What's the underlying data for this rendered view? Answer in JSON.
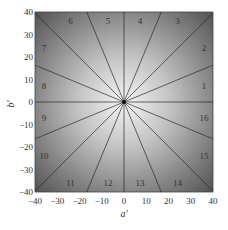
{
  "chart_data": {
    "type": "diagram-sectors",
    "title": "",
    "xlabel": "a′",
    "ylabel": "b′",
    "xlim": [
      -40,
      40
    ],
    "ylim": [
      -40,
      40
    ],
    "xticks": [
      -40,
      -30,
      -20,
      -10,
      0,
      10,
      20,
      30,
      40
    ],
    "yticks": [
      -40,
      -30,
      -20,
      -10,
      0,
      10,
      20,
      30,
      40
    ],
    "grid": false,
    "sector_count": 16,
    "sector_angle_deg": 22.5,
    "boundary_angles_deg": [
      0,
      22.5,
      45,
      67.5,
      90,
      112.5,
      135,
      157.5,
      180,
      202.5,
      225,
      247.5,
      270,
      292.5,
      315,
      337.5
    ],
    "sectors": [
      {
        "label": "1",
        "center_angle_deg": 11.25
      },
      {
        "label": "2",
        "center_angle_deg": 33.75
      },
      {
        "label": "3",
        "center_angle_deg": 56.25
      },
      {
        "label": "4",
        "center_angle_deg": 78.75
      },
      {
        "label": "5",
        "center_angle_deg": 101.25
      },
      {
        "label": "6",
        "center_angle_deg": 123.75
      },
      {
        "label": "7",
        "center_angle_deg": 146.25
      },
      {
        "label": "8",
        "center_angle_deg": 168.75
      },
      {
        "label": "9",
        "center_angle_deg": 191.25
      },
      {
        "label": "10",
        "center_angle_deg": 213.75
      },
      {
        "label": "11",
        "center_angle_deg": 236.25
      },
      {
        "label": "12",
        "center_angle_deg": 258.75
      },
      {
        "label": "13",
        "center_angle_deg": 281.25
      },
      {
        "label": "14",
        "center_angle_deg": 303.75
      },
      {
        "label": "15",
        "center_angle_deg": 326.25
      },
      {
        "label": "16",
        "center_angle_deg": 348.75
      }
    ],
    "background": "radial gradient, light at center (0,0) to dark gray at edges"
  },
  "colors": {
    "center": "#f2f2f2",
    "edge": "#5a5a5a",
    "lines": "#2a2a2a",
    "text": "#333333"
  }
}
